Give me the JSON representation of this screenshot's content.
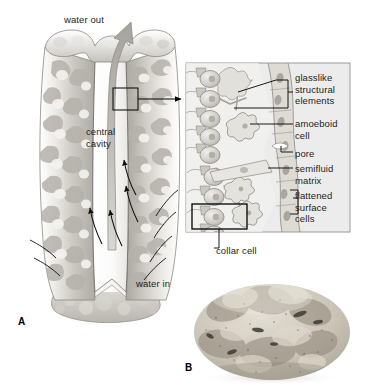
{
  "figure": {
    "panels": [
      {
        "id": "A",
        "letter": "A",
        "type": "illustration",
        "subject": "cutaway sponge body with water flow"
      },
      {
        "id": "B",
        "letter": "B",
        "type": "photograph",
        "subject": "whole sponge specimen"
      }
    ]
  },
  "sponge_diagram": {
    "labels": {
      "water_out": "water out",
      "central_cavity": "central\ncavity",
      "water_in": "water in"
    },
    "callout_box": {
      "present": true
    },
    "flow_arrows": {
      "outflow_count": 1,
      "inflow_count": 4
    }
  },
  "inset": {
    "labels": {
      "glasslike": "glasslike\nstructural\nelements",
      "amoeboid": "amoeboid\ncell",
      "pore": "pore",
      "semifluid": "semifluid\nmatrix",
      "flattened": "flattened\nsurface\ncells",
      "collar": "collar cell"
    },
    "highlight_box": {
      "target": "collar cell"
    },
    "background": "#ececec",
    "border": "#9a9a9a"
  },
  "colors": {
    "ink": "#231f20",
    "line": "#000000",
    "sponge_light": "#f2f1ef",
    "sponge_mid": "#cfcdc9",
    "sponge_dark": "#a8a5a0",
    "inset_bg": "#ececec",
    "inset_border": "#9a9a9a",
    "cell_fill": "#d6d3cd",
    "cell_stroke": "#8d8a85",
    "photo_body": "#cfc8ba",
    "photo_shadow": "#8d8madeupnone"
  }
}
